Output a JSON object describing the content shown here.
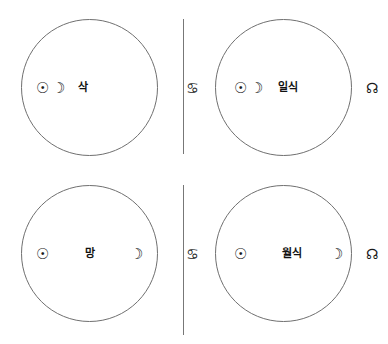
{
  "figure": {
    "type": "astronomy-diagram",
    "stroke_color": "#707070",
    "text_color": "#1a1a1a",
    "background_color": "#ffffff"
  },
  "glyphs": {
    "sun": "☉",
    "moon": "☽",
    "descending_node": "♋",
    "ascending_node": "☊"
  },
  "panels": [
    {
      "id": "new-moon",
      "position": "top-left",
      "label": "삭",
      "has_nodes": false,
      "node_left": "",
      "node_right": "",
      "sun": "☉",
      "moon": "☽",
      "arrangement": "sun-moon-adjacent-then-label"
    },
    {
      "id": "solar-eclipse",
      "position": "top-right",
      "label": "일식",
      "has_nodes": true,
      "node_left": "♋",
      "node_right": "☊",
      "sun": "☉",
      "moon": "☽",
      "arrangement": "node-sun-moon-label-node"
    },
    {
      "id": "full-moon",
      "position": "bottom-left",
      "label": "망",
      "has_nodes": false,
      "node_left": "",
      "node_right": "",
      "sun": "☉",
      "moon": "☽",
      "arrangement": "sun-label-moon"
    },
    {
      "id": "lunar-eclipse",
      "position": "bottom-right",
      "label": "월식",
      "has_nodes": true,
      "node_left": "♋",
      "node_right": "☊",
      "sun": "☉",
      "moon": "☽",
      "arrangement": "node-sun-label-moon-node"
    }
  ]
}
